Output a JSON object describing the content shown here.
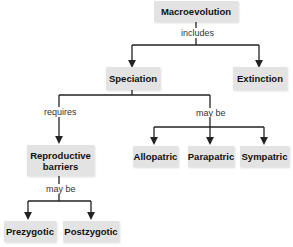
{
  "diagram": {
    "type": "concept-map",
    "nodes": {
      "macroevolution": "Macroevolution",
      "speciation": "Speciation",
      "extinction": "Extinction",
      "reproductive_barriers": "Reproductive barriers",
      "allopatric": "Allopatric",
      "parapatric": "Parapatric",
      "sympatric": "Sympatric",
      "prezygotic": "Prezygotic",
      "postzygotic": "Postzygotic"
    },
    "links": {
      "includes": "includes",
      "requires": "requires",
      "may_be_speciation": "may be",
      "may_be_barriers": "may be"
    },
    "edges": [
      {
        "from": "Macroevolution",
        "to": "Speciation",
        "label": "includes"
      },
      {
        "from": "Macroevolution",
        "to": "Extinction",
        "label": "includes"
      },
      {
        "from": "Speciation",
        "to": "Reproductive barriers",
        "label": "requires"
      },
      {
        "from": "Speciation",
        "to": "Allopatric",
        "label": "may be"
      },
      {
        "from": "Speciation",
        "to": "Parapatric",
        "label": "may be"
      },
      {
        "from": "Speciation",
        "to": "Sympatric",
        "label": "may be"
      },
      {
        "from": "Reproductive barriers",
        "to": "Prezygotic",
        "label": "may be"
      },
      {
        "from": "Reproductive barriers",
        "to": "Postzygotic",
        "label": "may be"
      }
    ],
    "colors": {
      "node_fill": "#e3e3e3",
      "line": "#222222"
    }
  }
}
